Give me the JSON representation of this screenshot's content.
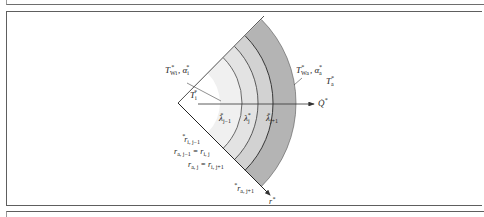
{
  "figure": {
    "type": "cylindrical-wall-layers-diagram",
    "colors": {
      "inner_region": "#ffffff",
      "layer_j_minus_1": "#ebebeb",
      "layer_j": "#d2d2d2",
      "layer_j_plus_1": "#b4b4b4",
      "lines": "#222222",
      "frame": "#5e5e5e"
    },
    "labels": {
      "inner_wall": {
        "base": "T",
        "sub": "Wi",
        "sup": "*",
        "sep": ", ",
        "alpha_base": "α",
        "alpha_sub": "i",
        "alpha_sup": "*"
      },
      "outer_wall": {
        "base": "T",
        "sub": "Wa",
        "sup": "*",
        "sep": ", ",
        "alpha_base": "α",
        "alpha_sub": "a",
        "alpha_sup": "*"
      },
      "inner_temp": {
        "base": "T",
        "sub": "i",
        "sup": "*"
      },
      "outer_temp": {
        "base": "T",
        "sub": "a",
        "sup": "*"
      },
      "heat_flow": {
        "base": "Q̇",
        "sup": "*"
      },
      "radius_axis": {
        "base": "r",
        "sup": "*"
      },
      "lambda_jm1": {
        "base": "λ",
        "sub": "j−1",
        "sup": "*"
      },
      "lambda_j": {
        "base": "λ",
        "sub": "j",
        "sup": "*"
      },
      "lambda_jp1": {
        "base": "λ",
        "sub": "j+1",
        "sup": "*"
      },
      "r_i_jm1": {
        "base": "r",
        "sub": "i, j−1",
        "sup": "*"
      },
      "r_a_jm1_eq": {
        "left_base": "r",
        "left_sub": "a, j−1",
        "eq": " = ",
        "right_base": "r",
        "right_sub": "i, j",
        "sup": "*"
      },
      "r_a_j_eq": {
        "left_base": "r",
        "left_sub": "a, j",
        "eq": " = ",
        "right_base": "r",
        "right_sub": "i, j+1",
        "sup": "*"
      },
      "r_a_jp1": {
        "base": "r",
        "sub": "a, j+1",
        "sup": "*"
      }
    }
  }
}
